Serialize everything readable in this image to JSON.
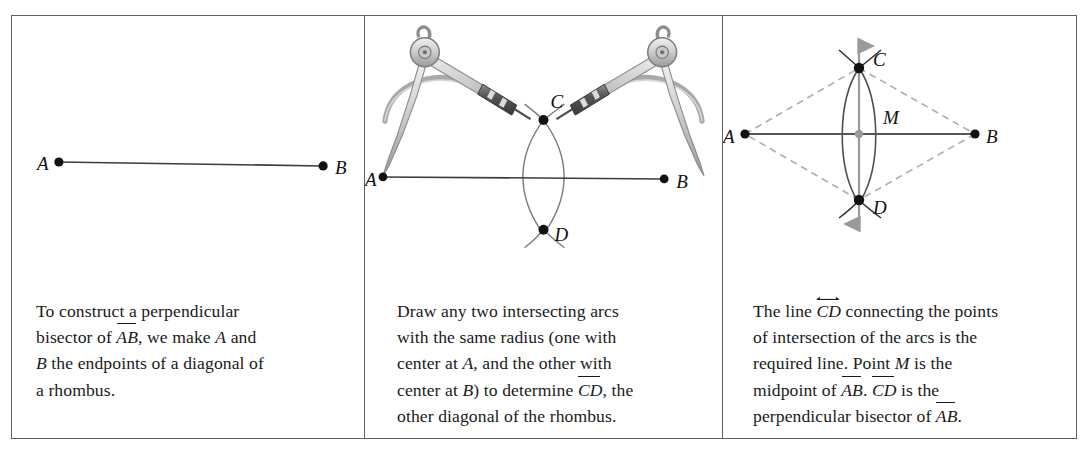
{
  "figure": {
    "border_color": "#5f5f5f",
    "ink_color": "#1a1a1a",
    "guide_color": "#9a9a9a",
    "arc_color": "#6e6e6e"
  },
  "panels": [
    {
      "id": "panel-1",
      "labels": {
        "A": "A",
        "B": "B"
      },
      "caption": {
        "line1": "To construct a perpendicular",
        "line2_pre": "bisector of ",
        "line2_seg": "AB",
        "line2_mid": ",  we make ",
        "line2_var": "A",
        "line2_post": " and",
        "line3_var": "B",
        "line3_post": " the endpoints of a diagonal of",
        "line4": "a rhombus."
      }
    },
    {
      "id": "panel-2",
      "labels": {
        "A": "A",
        "B": "B",
        "C": "C",
        "D": "D"
      },
      "caption": {
        "line1": "Draw any two intersecting arcs",
        "line2": "with the same radius (one with",
        "line3_pre": "center at ",
        "line3_var": "A",
        "line3_post": ", and the other with",
        "line4_pre": "center at ",
        "line4_var": "B",
        "line4_mid": ") to determine ",
        "line4_seg": "CD",
        "line4_post": ", the",
        "line5": "other diagonal of the rhombus."
      }
    },
    {
      "id": "panel-3",
      "labels": {
        "A": "A",
        "B": "B",
        "C": "C",
        "D": "D",
        "M": "M"
      },
      "caption": {
        "line1_pre": "The line ",
        "line1_line": "CD",
        "line1_post": " connecting the points",
        "line2": "of intersection of the arcs is the",
        "line3_pre": "required line. Point ",
        "line3_var": "M",
        "line3_post": " is the",
        "line4_pre": "midpoint of ",
        "line4_seg1": "AB",
        "line4_mid": ". ",
        "line4_seg2": "CD",
        "line4_post": " is the",
        "line5_pre": "perpendicular bisector of ",
        "line5_seg": "AB",
        "line5_post": "."
      }
    }
  ]
}
